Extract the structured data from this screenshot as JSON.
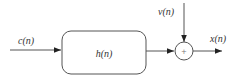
{
  "diagram": {
    "type": "block-diagram",
    "input_label": "c(n)",
    "block_label": "h(n)",
    "noise_label": "v(n)",
    "output_label": "x(n)",
    "summer_symbol": "+",
    "colors": {
      "stroke": "#555555",
      "text": "#333333",
      "background": "#ffffff"
    }
  }
}
